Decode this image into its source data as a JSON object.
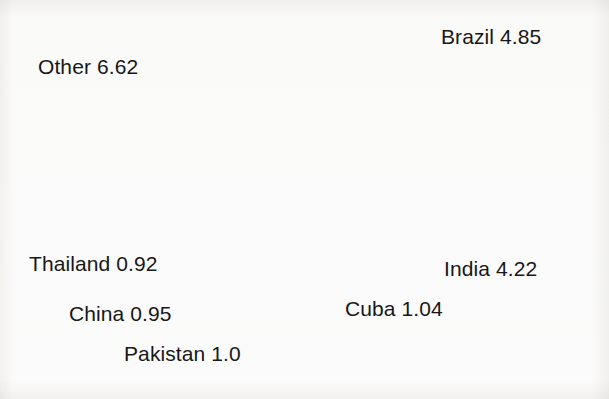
{
  "chart_data": {
    "type": "pie",
    "title": "",
    "subtitle": "",
    "xlabel": "",
    "ylabel": "",
    "legend_position": "none",
    "grid": false,
    "label_format": "{name} {value}",
    "total": 19.6,
    "start_angle_deg": 0,
    "direction": "clockwise",
    "categories": [
      "Brazil",
      "India",
      "Cuba",
      "Pakistan",
      "China",
      "Thailand",
      "Other"
    ],
    "values": [
      4.85,
      4.22,
      1.04,
      1.0,
      0.95,
      0.92,
      6.62
    ],
    "slices": [
      {
        "name": "Brazil",
        "value": 4.85,
        "value_text": "4.85",
        "label": "Brazil 4.85",
        "color": "#0d0d0d",
        "fill_name": "black",
        "start_deg": 0.0,
        "end_deg": 89.08
      },
      {
        "name": "India",
        "value": 4.22,
        "value_text": "4.22",
        "label": "India 4.22",
        "color": "#d4d4d4",
        "fill_name": "light-gray",
        "start_deg": 89.08,
        "end_deg": 166.59
      },
      {
        "name": "Cuba",
        "value": 1.04,
        "value_text": "1.04",
        "label": "Cuba 1.04",
        "color": "#8e8e8e",
        "fill_name": "medium-gray",
        "start_deg": 166.59,
        "end_deg": 185.69
      },
      {
        "name": "Pakistan",
        "value": 1.0,
        "value_text": "1.0",
        "label": "Pakistan 1.0",
        "color": "#2e2e2e",
        "fill_name": "near-black",
        "start_deg": 185.69,
        "end_deg": 204.06
      },
      {
        "name": "China",
        "value": 0.95,
        "value_text": "0.95",
        "label": "China 0.95",
        "color": "#ffffff",
        "fill_name": "white",
        "start_deg": 204.06,
        "end_deg": 221.51
      },
      {
        "name": "Thailand",
        "value": 0.92,
        "value_text": "0.92",
        "label": "Thailand 0.92",
        "color": "#4a4a4a",
        "fill_name": "dark-gray",
        "start_deg": 221.51,
        "end_deg": 238.41
      },
      {
        "name": "Other",
        "value": 6.62,
        "value_text": "6.62",
        "label": "Other 6.62",
        "color": "#9c9c9c",
        "fill_name": "gray",
        "start_deg": 238.41,
        "end_deg": 360.0
      }
    ]
  },
  "labels": {
    "brazil": "Brazil 4.85",
    "india": "India 4.22",
    "cuba": "Cuba 1.04",
    "pakistan": "Pakistan 1.0",
    "china": "China 0.95",
    "thailand": "Thailand 0.92",
    "other": "Other 6.62"
  },
  "style": {
    "outline_color": "#1a1a1a",
    "background": "#fdfdfc",
    "text_color": "#171717"
  }
}
